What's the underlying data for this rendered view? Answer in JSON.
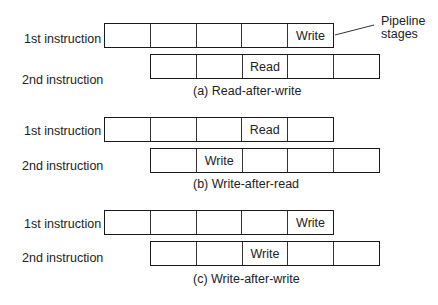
{
  "diagram": {
    "callout": {
      "line1": "Pipeline",
      "line2": "stages"
    },
    "panels": [
      {
        "caption": "(a) Read-after-write",
        "first": {
          "label": "1st instruction",
          "cells": [
            "",
            "",
            "",
            "",
            "Write"
          ]
        },
        "second": {
          "label": "2nd instruction",
          "cells": [
            "",
            "",
            "Read",
            "",
            ""
          ]
        }
      },
      {
        "caption": "(b) Write-after-read",
        "first": {
          "label": "1st instruction",
          "cells": [
            "",
            "",
            "",
            "Read",
            ""
          ]
        },
        "second": {
          "label": "2nd instruction",
          "cells": [
            "",
            "Write",
            "",
            "",
            ""
          ]
        }
      },
      {
        "caption": "(c) Write-after-write",
        "first": {
          "label": "1st instruction",
          "cells": [
            "",
            "",
            "",
            "",
            "Write"
          ]
        },
        "second": {
          "label": "2nd instruction",
          "cells": [
            "",
            "",
            "Write",
            "",
            ""
          ]
        }
      }
    ]
  }
}
